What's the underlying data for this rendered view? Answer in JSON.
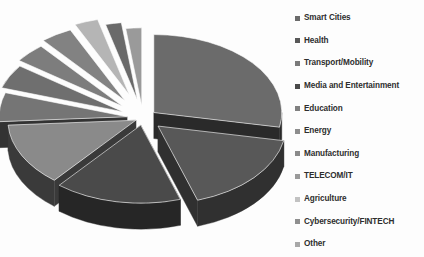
{
  "chart_data": {
    "type": "pie",
    "title": "",
    "subtitle": "",
    "xlabel": "",
    "ylabel": "",
    "style": "3d-exploded-pie",
    "background": "#fdfdfd",
    "legend_position": "right",
    "grid": false,
    "categories": [
      "Smart Cities",
      "Health",
      "Transport/Mobility",
      "Media and Entertainment",
      "Education",
      "Energy",
      "Manufacturing",
      "TELECOM/IT",
      "Agriculture",
      "Cybersecurity/FINTECH",
      "Other"
    ],
    "values": [
      28,
      17,
      16,
      13,
      6,
      5,
      4,
      4,
      3,
      2,
      2
    ],
    "colors": [
      "#6b6b6b",
      "#585858",
      "#4a4a4a",
      "#8a8a8a",
      "#757575",
      "#6f6f6f",
      "#7d7d7d",
      "#828282",
      "#b5b5b5",
      "#6a6a6a",
      "#9a9a9a"
    ],
    "side_colors": [
      "#2a2a2a",
      "#303030",
      "#262626",
      "#3a3a3a",
      "#333333",
      "#2f2f2f",
      "#363636",
      "#383838",
      "#6e6e6e",
      "#2c2c2c",
      "#4f4f4f"
    ]
  },
  "legend": {
    "items": [
      {
        "label": "Smart Cities",
        "color": "#6b6b6b"
      },
      {
        "label": "Health",
        "color": "#585858"
      },
      {
        "label": "Transport/Mobility",
        "color": "#7a7a7a"
      },
      {
        "label": "Media and Entertainment",
        "color": "#4a4a4a"
      },
      {
        "label": "Education",
        "color": "#808080"
      },
      {
        "label": "Energy",
        "color": "#8d8d8d"
      },
      {
        "label": "Manufacturing",
        "color": "#8a8a8a"
      },
      {
        "label": "TELECOM/IT",
        "color": "#9a9a9a"
      },
      {
        "label": "Agriculture",
        "color": "#c2c2c2"
      },
      {
        "label": "Cybersecurity/FINTECH",
        "color": "#8f8f8f"
      },
      {
        "label": "Other",
        "color": "#a8a8a8"
      }
    ]
  }
}
